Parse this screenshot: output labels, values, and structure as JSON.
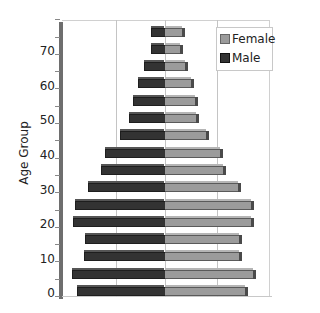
{
  "chart_data": {
    "type": "bar",
    "orientation": "horizontal",
    "subtype": "population-pyramid-3d",
    "title": "",
    "xlabel": "",
    "ylabel": "Age Group",
    "y_tick_labels": [
      "0",
      "10",
      "20",
      "30",
      "40",
      "50",
      "60",
      "70"
    ],
    "categories": [
      "0",
      "5",
      "10",
      "15",
      "20",
      "25",
      "30",
      "35",
      "40",
      "45",
      "50",
      "55",
      "60",
      "65",
      "70",
      "75"
    ],
    "series": [
      {
        "name": "Male",
        "color": "#333333",
        "values": [
          -88,
          -93,
          -81,
          -80,
          -92,
          -90,
          -77,
          -64,
          -60,
          -45,
          -36,
          -32,
          -27,
          -21,
          -14,
          -14
        ]
      },
      {
        "name": "Female",
        "color": "#9b9b9b",
        "values": [
          81,
          89,
          75,
          75,
          87,
          87,
          74,
          59,
          56,
          42,
          32,
          31,
          27,
          21,
          16,
          18
        ]
      }
    ],
    "value_units": "relative (pixels from center, no x tick labels shown)",
    "grid": true,
    "legend_position": "top-right",
    "legend": [
      "Female",
      "Male"
    ]
  },
  "axis": {
    "title": "Age Group",
    "ticks": [
      "70",
      "60",
      "50",
      "40",
      "30",
      "20",
      "10",
      "0"
    ]
  },
  "legend": {
    "female_label": "Female",
    "male_label": "Male",
    "female_color": "#9b9b9b",
    "male_color": "#333333"
  }
}
